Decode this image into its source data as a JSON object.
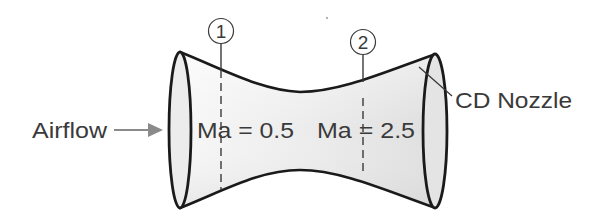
{
  "diagram": {
    "labels": {
      "airflow": "Airflow",
      "nozzle": "CD Nozzle",
      "station1_number": "1",
      "station2_number": "2",
      "station1_mach": "Ma = 0.5",
      "station2_mach": "Ma = 2.5"
    },
    "stations": [
      {
        "id": "1",
        "mach": 0.5,
        "region": "converging"
      },
      {
        "id": "2",
        "mach": 2.5,
        "region": "diverging"
      }
    ],
    "colors": {
      "outline": "#1a1a1a",
      "fill_light": "#f4f4f4",
      "fill_dark": "#d9d9d9",
      "arrow": "#8a8a8a",
      "text": "#3a3a3a"
    }
  }
}
